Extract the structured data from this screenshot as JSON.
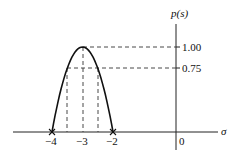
{
  "chart_data": {
    "type": "line",
    "title": "",
    "xlabel": "σ",
    "ylabel": "p(s)",
    "series": [
      {
        "name": "p(s)",
        "description": "downward parabola p(s) = 1 - (s+3)^2 on [-4, -2]",
        "x": [
          -4,
          -3.75,
          -3.5,
          -3.25,
          -3,
          -2.75,
          -2.5,
          -2.25,
          -2
        ],
        "y": [
          0,
          0.4375,
          0.75,
          0.9375,
          1.0,
          0.9375,
          0.75,
          0.4375,
          0
        ]
      }
    ],
    "x_ticks": [
      {
        "value": -4,
        "label": "−4"
      },
      {
        "value": -3,
        "label": "−3"
      },
      {
        "value": -2,
        "label": "−2"
      },
      {
        "value": 0,
        "label": "0"
      }
    ],
    "y_ticks": [
      {
        "value": 1.0,
        "label": "1.00"
      },
      {
        "value": 0.75,
        "label": "0.75"
      }
    ],
    "roots": [
      {
        "x": -4,
        "marker": "×"
      },
      {
        "x": -2,
        "marker": "×"
      }
    ],
    "guide_lines": [
      {
        "type": "horizontal",
        "y": 1.0,
        "from_x": -3
      },
      {
        "type": "horizontal",
        "y": 0.75,
        "from_x": -3.5
      },
      {
        "type": "vertical",
        "x": -3.5,
        "to_y": 0.75
      },
      {
        "type": "vertical",
        "x": -3,
        "to_y": 1.0
      },
      {
        "type": "vertical",
        "x": -2.5,
        "to_y": 0.75
      }
    ],
    "xlim": [
      -4.6,
      1.5
    ],
    "ylim": [
      -0.2,
      1.4
    ],
    "grid": false,
    "legend": "none"
  },
  "labels": {
    "y_axis": "p(s)",
    "x_axis": "σ",
    "tick_1_00": "1.00",
    "tick_0_75": "0.75",
    "tick_neg4": "−4",
    "tick_neg3": "−3",
    "tick_neg2": "−2",
    "tick_0": "0"
  }
}
